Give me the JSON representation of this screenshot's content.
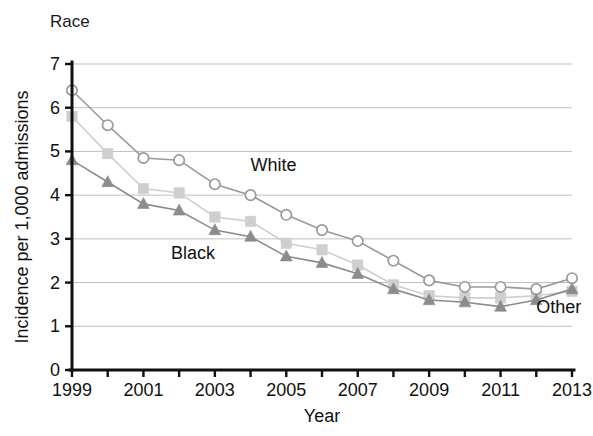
{
  "chart_data": {
    "type": "line",
    "title": "Race",
    "xlabel": "Year",
    "ylabel": "Incidence per 1,000 admissions",
    "x": [
      1999,
      2000,
      2001,
      2002,
      2003,
      2004,
      2005,
      2006,
      2007,
      2008,
      2009,
      2010,
      2011,
      2012,
      2013
    ],
    "categories": [
      "1999",
      "2000",
      "2001",
      "2002",
      "2003",
      "2004",
      "2005",
      "2006",
      "2007",
      "2008",
      "2009",
      "2010",
      "2011",
      "2012",
      "2013"
    ],
    "xtick_labels": [
      "1999",
      "",
      "2001",
      "",
      "2003",
      "",
      "2005",
      "",
      "2007",
      "",
      "2009",
      "",
      "2011",
      "",
      "2013"
    ],
    "ytick_labels": [
      "0",
      "1",
      "2",
      "3",
      "4",
      "5",
      "6",
      "7"
    ],
    "xlim": [
      1999,
      2013
    ],
    "ylim": [
      0,
      7
    ],
    "grid": "horizontal",
    "legend_position": "inline-annotations",
    "series": [
      {
        "name": "White",
        "marker": "open-circle",
        "color": "#9a9a9a",
        "label_x": 2004,
        "label_y": 4.55,
        "values": [
          6.4,
          5.6,
          4.85,
          4.8,
          4.25,
          4.0,
          3.55,
          3.2,
          2.95,
          2.5,
          2.05,
          1.9,
          1.9,
          1.85,
          2.1
        ]
      },
      {
        "name": "Black",
        "marker": "filled-square",
        "color": "#cfcfcf",
        "label_x": 2003,
        "label_y": 2.55,
        "values": [
          5.8,
          4.95,
          4.15,
          4.05,
          3.5,
          3.4,
          2.9,
          2.75,
          2.4,
          1.95,
          1.7,
          1.65,
          1.65,
          1.7,
          1.8
        ]
      },
      {
        "name": "Other",
        "marker": "filled-triangle",
        "color": "#8c8c8c",
        "label_x": 2012,
        "label_y": 1.3,
        "values": [
          4.8,
          4.3,
          3.8,
          3.65,
          3.2,
          3.05,
          2.6,
          2.45,
          2.2,
          1.85,
          1.6,
          1.55,
          1.45,
          1.6,
          1.85
        ]
      }
    ]
  },
  "plot": {
    "left": 72,
    "right": 572,
    "top": 64,
    "bottom": 370
  },
  "labels": {
    "white": "White",
    "black": "Black",
    "other": "Other"
  },
  "colors": {
    "white_series": "#9a9a9a",
    "black_series": "#cfcfcf",
    "other_series": "#8c8c8c",
    "grid": "#bfbfbf",
    "axis": "#101010",
    "text": "#111111",
    "background": "#ffffff"
  }
}
